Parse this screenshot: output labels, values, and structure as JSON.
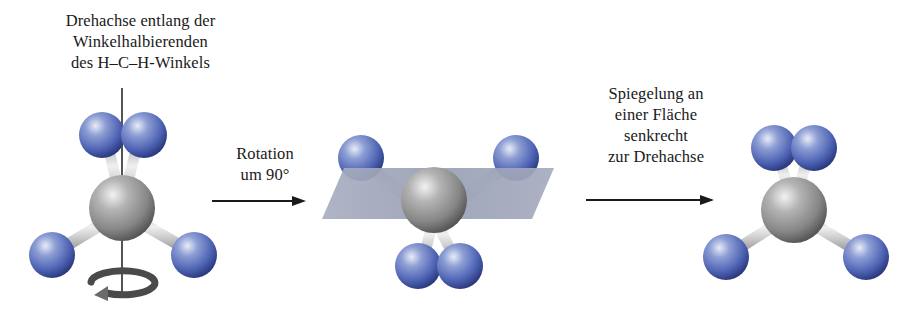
{
  "figure": {
    "background_color": "#ffffff"
  },
  "captions": {
    "axis_label": "Drehachse entlang der\nWinkelhalbierenden\ndes H–C–H-Winkels",
    "rotation_label": "Rotation\num 90°",
    "reflection_label": "Spiegelung an\neiner Fläche\nsenkrecht\nzur Drehachse"
  },
  "colors": {
    "hydrogen": "#5a6fbe",
    "hydrogen_light": "#b9c4e4",
    "hydrogen_dark": "#2f3f86",
    "carbon": "#8f8f8f",
    "carbon_light": "#e0e0e0",
    "carbon_dark": "#5a5a5a",
    "bond": "#cfcfcf",
    "bond_dark": "#9a9a9a",
    "mirror_plane": "#9aa0b4",
    "axis_line": "#2a2a2a",
    "arrow": "#1a1a1a",
    "text": "#1a1a1a"
  },
  "molecules": [
    {
      "name": "molecule-initial",
      "state": "vor der Drehung",
      "central_atom": "C",
      "ligand_atoms": [
        "H",
        "H",
        "H",
        "H"
      ],
      "has_rotation_axis": true,
      "has_curved_arrow": true,
      "has_mirror_plane": false
    },
    {
      "name": "molecule-rotated",
      "state": "nach Rotation um 90°",
      "central_atom": "C",
      "ligand_atoms": [
        "H",
        "H",
        "H",
        "H"
      ],
      "has_rotation_axis": false,
      "has_curved_arrow": false,
      "has_mirror_plane": true
    },
    {
      "name": "molecule-reflected",
      "state": "nach Spiegelung",
      "central_atom": "C",
      "ligand_atoms": [
        "H",
        "H",
        "H",
        "H"
      ],
      "has_rotation_axis": false,
      "has_curved_arrow": false,
      "has_mirror_plane": false
    }
  ]
}
